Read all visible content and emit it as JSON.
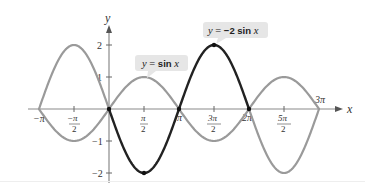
{
  "chart_data": {
    "type": "line",
    "title": "",
    "xlabel": "x",
    "ylabel": "y",
    "xlim": [
      -3.14159,
      9.42478
    ],
    "ylim": [
      -2,
      2
    ],
    "grid": false,
    "x_tick_labels": [
      "−π",
      "−π/2",
      "π/2",
      "π",
      "3π/2",
      "2π",
      "5π/2",
      "3π"
    ],
    "x_ticks": [
      -3.14159,
      -1.5708,
      1.5708,
      3.14159,
      4.71239,
      6.28319,
      7.85398,
      9.42478
    ],
    "y_tick_labels": [
      "2",
      "1",
      "−1",
      "−2"
    ],
    "y_ticks": [
      2,
      1,
      -1,
      -2
    ],
    "series": [
      {
        "name": "y = sin x",
        "color": "#9a9a9a",
        "x": [
          -3.14159,
          -1.5708,
          0,
          1.5708,
          3.14159,
          4.71239,
          6.28319,
          7.85398,
          9.42478
        ],
        "values": [
          0,
          -1,
          0,
          1,
          0,
          -1,
          0,
          1,
          0
        ]
      },
      {
        "name": "y = −2 sin x",
        "color": "#222222",
        "highlight_interval": [
          0,
          6.28319
        ],
        "outside_color": "#9a9a9a",
        "x": [
          -3.14159,
          -1.5708,
          0,
          1.5708,
          3.14159,
          4.71239,
          6.28319,
          7.85398,
          9.42478
        ],
        "values": [
          0,
          2,
          0,
          -2,
          0,
          2,
          0,
          -2,
          0
        ]
      }
    ],
    "annotations": [
      {
        "text": "y = sin x",
        "points_to": [
          1.5708,
          1
        ]
      },
      {
        "text": "y = −2 sin x",
        "points_to": [
          4.71239,
          2
        ]
      }
    ],
    "marked_points": [
      [
        0,
        0
      ],
      [
        1.5708,
        -2
      ],
      [
        3.14159,
        0
      ],
      [
        4.71239,
        2
      ],
      [
        6.28319,
        0
      ]
    ]
  },
  "labels": {
    "x_axis": "x",
    "y_axis": "y",
    "y2": "2",
    "y1": "1",
    "ym1": "−1",
    "ym2": "−2",
    "neg_pi": "−π",
    "neg_pi_half_num": "−π",
    "two": "2",
    "pi_half_num": "π",
    "pi": "π",
    "three_pi_half_num": "3π",
    "two_pi": "2π",
    "five_pi_half_num": "5π",
    "three_pi": "3π"
  },
  "callouts": {
    "sin": {
      "y": "y",
      "eq": " = ",
      "fn": "sin",
      "x": " x"
    },
    "neg2sin": {
      "y": "y",
      "eq": " = ",
      "coef": "−2",
      "fn": "sin",
      "x": " x"
    }
  }
}
